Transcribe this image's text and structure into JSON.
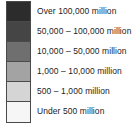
{
  "legend": {
    "title": "Population legend",
    "border_color": "#4a4a4a",
    "text_color": "#1c1c1c",
    "background": "#ffffff",
    "entries": [
      {
        "label": "Over 100,000 million",
        "swatch_color": "#2c2c2c",
        "swatch_name": "swatch-over-100000-million"
      },
      {
        "label": "50,000 – 100,000 million",
        "swatch_color": "#454545",
        "swatch_name": "swatch-50000-100000-million"
      },
      {
        "label": "10,000 – 50,000 million",
        "swatch_color": "#6f6f6f",
        "swatch_name": "swatch-10000-50000-million"
      },
      {
        "label": "1,000 – 10,000 million",
        "swatch_color": "#a3a3a3",
        "swatch_name": "swatch-1000-10000-million"
      },
      {
        "label": "500 – 1,000 million",
        "swatch_color": "#d5d5d5",
        "swatch_name": "swatch-500-1000-million"
      },
      {
        "label": "Under 500 million",
        "swatch_color": "#f6f6f6",
        "swatch_name": "swatch-under-500-million"
      }
    ]
  }
}
